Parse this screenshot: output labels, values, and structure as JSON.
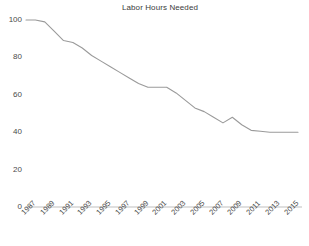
{
  "chart_data": {
    "type": "line",
    "title": "Labor Hours Needed",
    "xlabel": "",
    "ylabel": "",
    "ylim": [
      0,
      100
    ],
    "yticks": [
      0,
      20,
      40,
      60,
      80,
      100
    ],
    "xlim": [
      1987,
      2016
    ],
    "xticks": [
      1987,
      1989,
      1991,
      1993,
      1995,
      1997,
      1999,
      2001,
      2003,
      2005,
      2007,
      2009,
      2011,
      2013,
      2015
    ],
    "xtick_labels": [
      "1987",
      "1989",
      "1991",
      "1993",
      "1995",
      "1997",
      "1999",
      "2001",
      "2003",
      "2005",
      "2007",
      "2009",
      "2011",
      "2013",
      "2015"
    ],
    "grid": false,
    "legend": false,
    "legend_position": "none",
    "line_color": "#9a9a9a",
    "axis_color": "#bfbfbf",
    "text_color": "#4a4a4a",
    "background": "#ffffff",
    "x": [
      1987,
      1988,
      1989,
      1990,
      1991,
      1992,
      1993,
      1994,
      1995,
      1996,
      1997,
      1998,
      1999,
      2000,
      2001,
      2002,
      2003,
      2004,
      2005,
      2006,
      2007,
      2008,
      2009,
      2010,
      2011,
      2012,
      2013,
      2014,
      2015,
      2016
    ],
    "values": [
      100,
      100,
      99,
      94,
      89,
      88,
      85,
      81,
      78,
      75,
      72,
      69,
      66,
      64,
      64,
      64,
      61,
      57,
      53,
      51,
      48,
      45,
      48,
      44,
      41,
      40.5,
      40,
      40,
      40,
      40
    ],
    "series": [
      {
        "name": "Labor Hours Needed",
        "values": [
          100,
          100,
          99,
          94,
          89,
          88,
          85,
          81,
          78,
          75,
          72,
          69,
          66,
          64,
          64,
          64,
          61,
          57,
          53,
          51,
          48,
          45,
          48,
          44,
          41,
          40.5,
          40,
          40,
          40,
          40
        ]
      }
    ]
  },
  "yticks_text": {
    "t0": "0",
    "t20": "20",
    "t40": "40",
    "t60": "60",
    "t80": "80",
    "t100": "100"
  }
}
